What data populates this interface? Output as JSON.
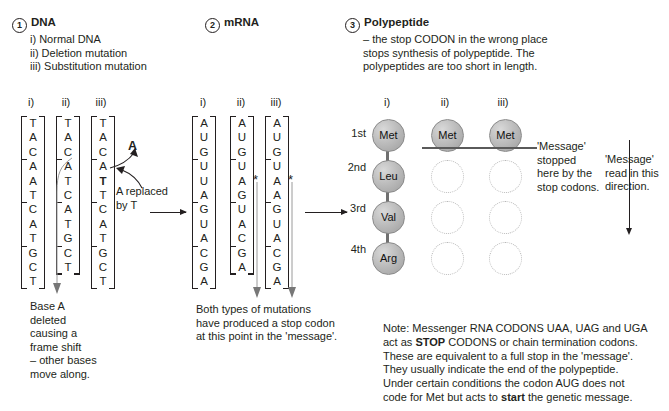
{
  "sections": {
    "dna": {
      "number": "1",
      "title": "DNA",
      "items": [
        "i) Normal DNA",
        "ii) Deletion mutation",
        "iii) Substitution mutation"
      ],
      "columns": [
        {
          "roman": "i)",
          "bases": [
            "T",
            "A",
            "C",
            "A",
            "A",
            "T",
            "C",
            "A",
            "T",
            "G",
            "C",
            "T"
          ]
        },
        {
          "roman": "ii)",
          "bases": [
            "T",
            "A",
            "C",
            "A",
            "T",
            "C",
            "A",
            "T",
            "G",
            "C",
            "T"
          ]
        },
        {
          "roman": "iii)",
          "bases": [
            "T",
            "A",
            "C",
            "A",
            "T",
            "T",
            "C",
            "A",
            "T",
            "G",
            "C",
            "T"
          ],
          "bold_index": 4
        }
      ],
      "substitution_label": "A",
      "substitution_caption_line1": "A replaced",
      "substitution_caption_line2": "by T",
      "deletion_caption": [
        "Base A",
        "deleted",
        "causing a",
        "frame shift",
        "– other bases",
        "move along."
      ]
    },
    "mrna": {
      "number": "2",
      "title": "mRNA",
      "columns": [
        {
          "roman": "i)",
          "bases": [
            "A",
            "U",
            "G",
            "U",
            "U",
            "A",
            "G",
            "U",
            "A",
            "C",
            "G",
            "A"
          ]
        },
        {
          "roman": "ii)",
          "bases": [
            "A",
            "U",
            "G",
            "U",
            "A",
            "G",
            "U",
            "A",
            "C",
            "G",
            "A"
          ],
          "star": true
        },
        {
          "roman": "iii)",
          "bases": [
            "A",
            "U",
            "G",
            "U",
            "A",
            "A",
            "G",
            "U",
            "A",
            "C",
            "G",
            "A"
          ],
          "star": true
        }
      ],
      "caption": [
        "Both types of mutations",
        "have produced a stop codon",
        "at this point in the 'message'."
      ]
    },
    "polypeptide": {
      "number": "3",
      "title": "Polypeptide",
      "description": [
        "– the stop CODON in the wrong place",
        "stops synthesis of polypeptide. The",
        "polypeptides are too short in length."
      ],
      "romans": [
        "i)",
        "ii)",
        "iii)"
      ],
      "ordinals": [
        "1st",
        "2nd",
        "3rd",
        "4th"
      ],
      "chain_i": [
        "Met",
        "Leu",
        "Val",
        "Arg"
      ],
      "chain_ii": [
        "Met",
        "",
        "",
        ""
      ],
      "chain_iii": [
        "Met",
        "",
        "",
        ""
      ],
      "stopped_caption": [
        "'Message'",
        "stopped",
        "here by the",
        "stop codons."
      ],
      "direction_caption": [
        "'Message'",
        "read in this",
        "direction."
      ]
    },
    "note": {
      "lines": [
        "Note: Messenger RNA CODONS UAA, UAG and UGA",
        "act as STOP CODONS or chain termination codons.",
        "These are equivalent to a full stop in the 'message'.",
        "They usually indicate the end of the polypeptide.",
        "Under certain conditions the codon AUG does not",
        "code for Met but acts to start the genetic message."
      ],
      "bold_terms": [
        "STOP",
        "start"
      ]
    }
  },
  "colors": {
    "ink": "#231f20",
    "bead_fill": "#bdbdbd",
    "bead_empty_border": "#b9b9b9",
    "stop_line": "#5a5a5a",
    "leader": "#9a9a9a"
  }
}
